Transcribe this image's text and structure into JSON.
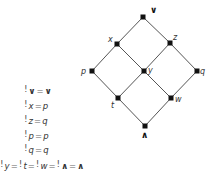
{
  "diagram": {
    "type": "lattice-hasse-diagram",
    "nodes": [
      {
        "id": "top",
        "label": "∨",
        "x": 143,
        "y": 17,
        "lx": 150,
        "ly": 13,
        "bold": true
      },
      {
        "id": "x",
        "label": "x",
        "x": 117,
        "y": 44,
        "lx": 108,
        "ly": 42,
        "bold": false
      },
      {
        "id": "z",
        "label": "z",
        "x": 170,
        "y": 43,
        "lx": 173,
        "ly": 40,
        "bold": false
      },
      {
        "id": "p",
        "label": "p",
        "x": 92,
        "y": 71,
        "lx": 81,
        "ly": 74,
        "bold": false
      },
      {
        "id": "y",
        "label": "y",
        "x": 144,
        "y": 71,
        "lx": 148,
        "ly": 73,
        "bold": false
      },
      {
        "id": "q",
        "label": "q",
        "x": 197,
        "y": 71,
        "lx": 200,
        "ly": 74,
        "bold": false
      },
      {
        "id": "t",
        "label": "t",
        "x": 118,
        "y": 98,
        "lx": 111,
        "ly": 108,
        "bold": false
      },
      {
        "id": "w",
        "label": "w",
        "x": 171,
        "y": 98,
        "lx": 175,
        "ly": 102,
        "bold": false
      },
      {
        "id": "bottom",
        "label": "∧",
        "x": 145,
        "y": 126,
        "lx": 141,
        "ly": 138,
        "bold": true
      }
    ],
    "edges": [
      [
        "top",
        "x"
      ],
      [
        "top",
        "z"
      ],
      [
        "x",
        "p"
      ],
      [
        "x",
        "y"
      ],
      [
        "z",
        "y"
      ],
      [
        "z",
        "q"
      ],
      [
        "p",
        "t"
      ],
      [
        "y",
        "t"
      ],
      [
        "y",
        "w"
      ],
      [
        "q",
        "w"
      ],
      [
        "t",
        "bottom"
      ],
      [
        "w",
        "bottom"
      ]
    ]
  },
  "equations": [
    {
      "parts": [
        {
          "t": "!",
          "c": "bang"
        },
        {
          "t": "∨",
          "c": "bold"
        },
        {
          "t": "=",
          "c": "op"
        },
        {
          "t": "∨",
          "c": "bold"
        }
      ],
      "x": 24,
      "y": 0
    },
    {
      "parts": [
        {
          "t": "!",
          "c": "bang"
        },
        {
          "t": "x",
          "c": "v"
        },
        {
          "t": "=",
          "c": "op"
        },
        {
          "t": "p",
          "c": "v"
        }
      ],
      "x": 24,
      "y": 15
    },
    {
      "parts": [
        {
          "t": "!",
          "c": "bang"
        },
        {
          "t": "z",
          "c": "v"
        },
        {
          "t": "=",
          "c": "op"
        },
        {
          "t": "q",
          "c": "v"
        }
      ],
      "x": 24,
      "y": 30
    },
    {
      "parts": [
        {
          "t": "!",
          "c": "bang"
        },
        {
          "t": "p",
          "c": "v"
        },
        {
          "t": "=",
          "c": "op"
        },
        {
          "t": "p",
          "c": "v"
        }
      ],
      "x": 24,
      "y": 45
    },
    {
      "parts": [
        {
          "t": "!",
          "c": "bang"
        },
        {
          "t": "q",
          "c": "v"
        },
        {
          "t": "=",
          "c": "op"
        },
        {
          "t": "q",
          "c": "v"
        }
      ],
      "x": 24,
      "y": 59
    },
    {
      "parts": [
        {
          "t": "!",
          "c": "bang"
        },
        {
          "t": "y",
          "c": "v"
        },
        {
          "t": "=",
          "c": "op"
        },
        {
          "t": "!",
          "c": "bang"
        },
        {
          "t": "t",
          "c": "v"
        },
        {
          "t": "=",
          "c": "op"
        },
        {
          "t": "!",
          "c": "bang"
        },
        {
          "t": "w",
          "c": "v"
        },
        {
          "t": "=",
          "c": "op"
        },
        {
          "t": "!",
          "c": "bang"
        },
        {
          "t": "∧",
          "c": "bold"
        },
        {
          "t": "=",
          "c": "op"
        },
        {
          "t": "∧",
          "c": "bold"
        }
      ],
      "x": 0,
      "y": 75
    }
  ],
  "colors": {
    "edge": "#555555",
    "node": "#111111",
    "background": "#ffffff"
  }
}
